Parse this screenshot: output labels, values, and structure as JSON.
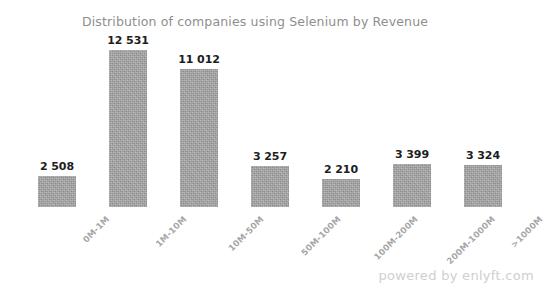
{
  "chart_data": {
    "type": "bar",
    "title": "Distribution of companies using Selenium by Revenue",
    "xlabel": "",
    "ylabel": "",
    "grid": false,
    "legend": "none",
    "axis_visible": false,
    "value_labels_shown": true,
    "thousands_separator": " ",
    "ylim": [
      0,
      12531
    ],
    "categories": [
      "0M-1M",
      "1M-10M",
      "10M-50M",
      "50M-100M",
      "100M-200M",
      "200M-1000M",
      ">1000M"
    ],
    "values": [
      2508,
      12531,
      11012,
      3257,
      2210,
      3399,
      3324
    ],
    "value_labels": [
      "2 508",
      "12 531",
      "11 012",
      "3 257",
      "2 210",
      "3 399",
      "3 324"
    ],
    "bar_color": "#a2a2a2",
    "title_color": "#8e8e8e",
    "label_color": "#1d1d1d",
    "tick_color": "#a6a6a6"
  },
  "footer": {
    "watermark": "powered by enlyft.com",
    "watermark_color": "#cfcfcf"
  }
}
